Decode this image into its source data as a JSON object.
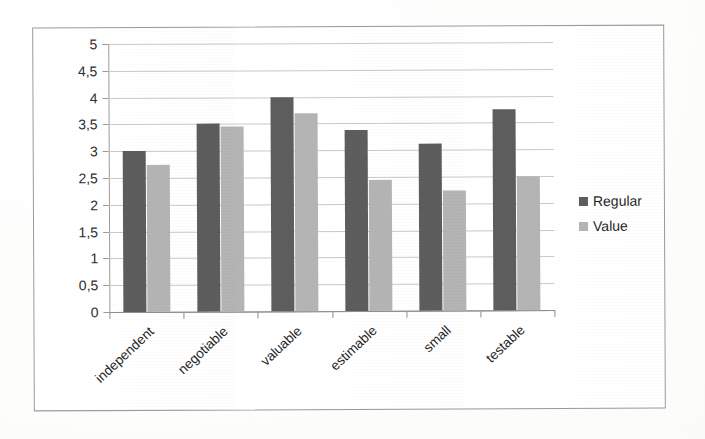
{
  "chart_data": {
    "type": "bar",
    "title": "",
    "xlabel": "",
    "ylabel": "",
    "ylim": [
      0,
      5
    ],
    "grid": true,
    "legend_position": "right",
    "categories": [
      "independent",
      "negotiable",
      "valuable",
      "estimable",
      "small",
      "testable"
    ],
    "series": [
      {
        "name": "Regular",
        "color": "#5d5d5d",
        "values": [
          3.0,
          3.5,
          4.0,
          3.37,
          3.12,
          3.75
        ]
      },
      {
        "name": "Value",
        "color": "#b4b4b4",
        "values": [
          2.75,
          3.45,
          3.7,
          2.45,
          2.23,
          2.5
        ]
      }
    ],
    "y_ticks": [
      {
        "value": 0,
        "label": "0"
      },
      {
        "value": 0.5,
        "label": "0,5"
      },
      {
        "value": 1,
        "label": "1"
      },
      {
        "value": 1.5,
        "label": "1,5"
      },
      {
        "value": 2,
        "label": "2"
      },
      {
        "value": 2.5,
        "label": "2,5"
      },
      {
        "value": 3,
        "label": "3"
      },
      {
        "value": 3.5,
        "label": "3,5"
      },
      {
        "value": 4,
        "label": "4"
      },
      {
        "value": 4.5,
        "label": "4,5"
      },
      {
        "value": 5,
        "label": "5"
      }
    ]
  },
  "legend": {
    "items": [
      {
        "label": "Regular",
        "color": "#5d5d5d"
      },
      {
        "label": "Value",
        "color": "#b4b4b4"
      }
    ]
  }
}
